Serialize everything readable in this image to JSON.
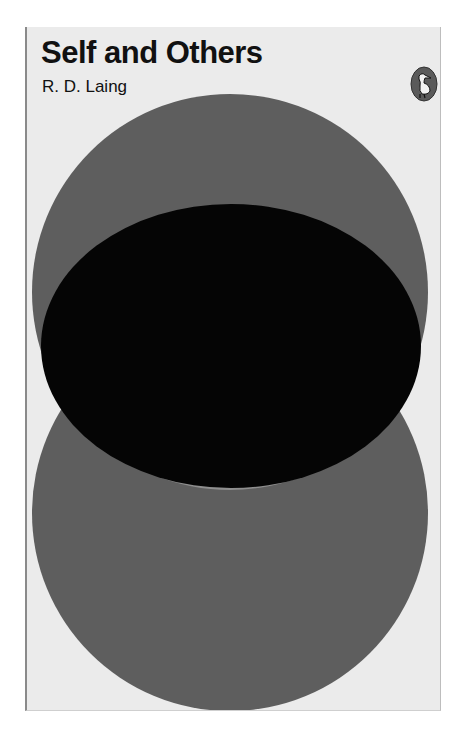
{
  "book": {
    "title": "Self and Others",
    "author": "R. D. Laing",
    "publisher_logo": "pelican-icon"
  },
  "colors": {
    "background": "#ebebeb",
    "circle_gray": "#5e5e5e",
    "overlap_light_gray": "#8c8c8c",
    "lens_black": "#050505"
  }
}
